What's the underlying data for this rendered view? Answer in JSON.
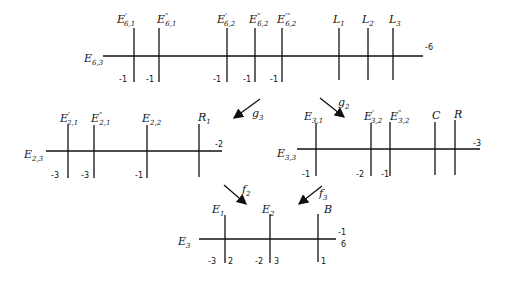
{
  "diagrams": {
    "top": {
      "base": {
        "label": "E",
        "sub": "6,3",
        "self_intersection": "-6"
      },
      "curves": [
        {
          "label": "E",
          "sup": "'",
          "sub": "6,1",
          "value": "-1"
        },
        {
          "label": "E",
          "sup": "\"",
          "sub": "6,1",
          "value": "-1"
        },
        {
          "label": "E",
          "sup": "'",
          "sub": "6,2",
          "value": "-1"
        },
        {
          "label": "E",
          "sup": "\"",
          "sub": "6,2",
          "value": "-1"
        },
        {
          "label": "E",
          "sup": "'\"",
          "sub": "6,2",
          "value": "-1"
        },
        {
          "label": "L",
          "sup": "",
          "sub": "1",
          "value": ""
        },
        {
          "label": "L",
          "sup": "",
          "sub": "2",
          "value": ""
        },
        {
          "label": "L",
          "sup": "",
          "sub": "3",
          "value": ""
        }
      ]
    },
    "left": {
      "base": {
        "label": "E",
        "sub": "2,3",
        "self_intersection": "-2"
      },
      "curves": [
        {
          "label": "E",
          "sup": "'",
          "sub": "2,1",
          "value": "-3"
        },
        {
          "label": "E",
          "sup": "\"",
          "sub": "2,1",
          "value": "-3"
        },
        {
          "label": "E",
          "sup": "",
          "sub": "2,2",
          "value": "-1"
        },
        {
          "label": "R",
          "sup": "",
          "sub": "1",
          "value": ""
        }
      ]
    },
    "right": {
      "base": {
        "label": "E",
        "sub": "3,3",
        "self_intersection": "-3"
      },
      "curves": [
        {
          "label": "E",
          "sup": "",
          "sub": "3,1",
          "value": "-1"
        },
        {
          "label": "E",
          "sup": "'",
          "sub": "3,2",
          "value": "-2"
        },
        {
          "label": "E",
          "sup": "\"",
          "sub": "3,2",
          "value": "-1"
        },
        {
          "label": "C",
          "sup": "",
          "sub": "",
          "value": ""
        },
        {
          "label": "R",
          "sup": "",
          "sub": "",
          "value": ""
        }
      ]
    },
    "bottom": {
      "base": {
        "label": "E",
        "sub": "3",
        "self_intersection": "-1",
        "self_intersection_2": "6"
      },
      "curves": [
        {
          "label": "E",
          "sup": "",
          "sub": "1",
          "value": "-3",
          "value2": "2"
        },
        {
          "label": "E",
          "sup": "",
          "sub": "2",
          "value": "-2",
          "value2": "3"
        },
        {
          "label": "B",
          "sup": "",
          "sub": "",
          "value": "",
          "value2": "1"
        }
      ]
    }
  },
  "arrows": [
    {
      "label": "g",
      "sub": "3",
      "from": "top",
      "to": "left"
    },
    {
      "label": "g",
      "sub": "2",
      "from": "top",
      "to": "right"
    },
    {
      "label": "f",
      "sub": "2",
      "from": "left",
      "to": "bottom"
    },
    {
      "label": "f",
      "sub": "3",
      "from": "right",
      "to": "bottom"
    }
  ]
}
